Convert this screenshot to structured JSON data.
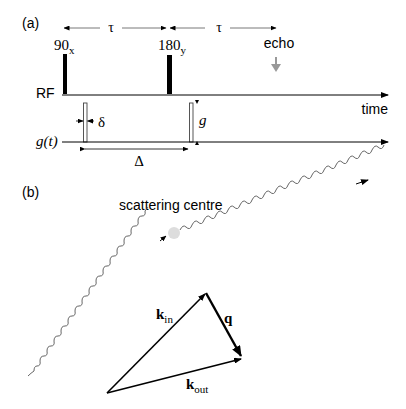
{
  "panel_a": {
    "label": "(a)",
    "tau_left": "τ",
    "tau_right": "τ",
    "pulse_90": "90",
    "pulse_90_sub": "x",
    "pulse_180": "180",
    "pulse_180_sub": "y",
    "echo": "echo",
    "rf_label": "RF",
    "time_label": "time",
    "delta_small": "δ",
    "gradient_label": "g",
    "gt_label": "g(t)",
    "delta_big": "Δ"
  },
  "panel_b": {
    "label": "(b)",
    "scattering_centre": "scattering centre",
    "k_in": "k",
    "k_in_sub": "in",
    "q": "q",
    "k_out": "k",
    "k_out_sub": "out"
  },
  "colors": {
    "line": "#000000",
    "echo_arrow": "#999999",
    "scatter_dot": "#dddddd",
    "wave": "#555555"
  }
}
